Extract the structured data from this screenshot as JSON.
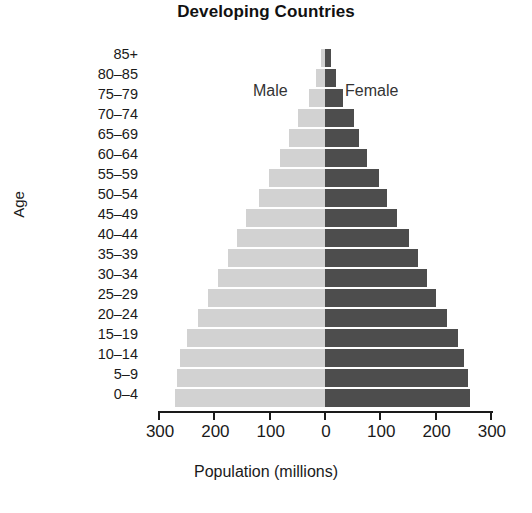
{
  "chart_data": {
    "type": "bar",
    "subtype": "population-pyramid",
    "title": "Developing Countries",
    "xlabel": "Population (millions)",
    "ylabel": "Age",
    "grid": false,
    "legend_position": "inside-top-center",
    "legend": [
      "Male",
      "Female"
    ],
    "xlim": [
      -300,
      300
    ],
    "xticks": [
      300,
      200,
      100,
      0,
      100,
      200,
      300
    ],
    "xtick_values": [
      -300,
      -200,
      -100,
      0,
      100,
      200,
      300
    ],
    "categories": [
      "85+",
      "80–85",
      "75–79",
      "70–74",
      "65–69",
      "60–64",
      "55–59",
      "50–54",
      "45–49",
      "40–44",
      "35–39",
      "30–34",
      "25–29",
      "20–24",
      "15–19",
      "10–14",
      "5–9",
      "0–4"
    ],
    "series": [
      {
        "name": "Male",
        "color": "#d2d2d2",
        "values": [
          8,
          17,
          29,
          48,
          66,
          82,
          101,
          120,
          142,
          160,
          176,
          193,
          212,
          230,
          250,
          262,
          268,
          272
        ]
      },
      {
        "name": "Female",
        "color": "#4d4d4d",
        "values": [
          10,
          20,
          33,
          52,
          62,
          76,
          98,
          113,
          131,
          151,
          169,
          184,
          200,
          220,
          240,
          251,
          258,
          262
        ]
      }
    ]
  },
  "axis": {
    "x_title": "Population (millions)",
    "y_title": "Age",
    "tick_labels": [
      "300",
      "200",
      "100",
      "0",
      "100",
      "200",
      "300"
    ]
  },
  "legend": {
    "male_label": "Male",
    "female_label": "Female"
  },
  "header": {
    "title": "Developing Countries"
  },
  "colors": {
    "male": "#d2d2d2",
    "female": "#4d4d4d",
    "axis": "#1a1a1a",
    "background": "#ffffff"
  }
}
